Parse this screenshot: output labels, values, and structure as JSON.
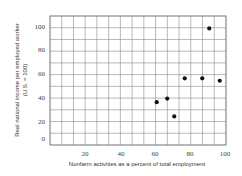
{
  "chart_data": {
    "type": "scatter",
    "title": "",
    "xlabel": "Nonfarm activities as a percent of total employment",
    "ylabel": "Real national income per employed worker",
    "ylabel_sub": "(U.S. = 100)",
    "xlim": [
      0,
      100
    ],
    "ylim": [
      0,
      110
    ],
    "x_ticks": [
      "20",
      "40",
      "60",
      "80",
      "100"
    ],
    "y_ticks": [
      "100",
      "80",
      "60",
      "40",
      "20",
      "0"
    ],
    "grid": true,
    "legend": null,
    "series": [
      {
        "name": "Countries",
        "points": [
          {
            "x": 61,
            "y": 36
          },
          {
            "x": 67,
            "y": 39
          },
          {
            "x": 71,
            "y": 24
          },
          {
            "x": 77,
            "y": 56
          },
          {
            "x": 87,
            "y": 56
          },
          {
            "x": 91,
            "y": 98
          },
          {
            "x": 97,
            "y": 54
          }
        ]
      }
    ]
  },
  "colors": {
    "grid": "#8a8a8a",
    "point": "#111111",
    "text": "#333333"
  }
}
